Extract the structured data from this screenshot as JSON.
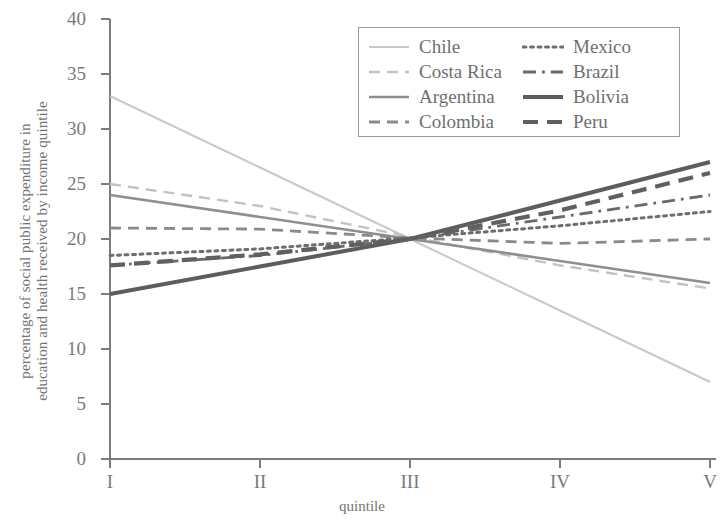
{
  "chart_data": {
    "type": "line",
    "title": "",
    "xlabel": "quintile",
    "ylabel": "percentage of social public expenditure in education and health received by income quintile",
    "ylabel_lines": [
      "percentage of social public expenditure in",
      "education and health received by income quintile"
    ],
    "categories": [
      "I",
      "II",
      "III",
      "IV",
      "V"
    ],
    "x_ticklabels": [
      "I",
      "II",
      "III",
      "IV",
      "V"
    ],
    "y_ticklabels": [
      "0",
      "5",
      "10",
      "15",
      "20",
      "25",
      "30",
      "35",
      "40"
    ],
    "yticks": [
      0,
      5,
      10,
      15,
      20,
      25,
      30,
      35,
      40
    ],
    "ylim": [
      0,
      40
    ],
    "xlim": [
      1,
      5
    ],
    "grid": false,
    "legend_position": "upper right",
    "series": [
      {
        "name": "Chile",
        "values": [
          33.0,
          26.5,
          20.0,
          13.5,
          7.0
        ],
        "style": "solid-thin",
        "color": "#c9c9c9",
        "width": 2.0
      },
      {
        "name": "Costa Rica",
        "values": [
          25.0,
          23.0,
          20.2,
          17.6,
          15.5
        ],
        "style": "dashed",
        "color": "#c2c2c2",
        "width": 2.4
      },
      {
        "name": "Argentina",
        "values": [
          24.0,
          22.0,
          20.0,
          18.0,
          16.0
        ],
        "style": "solid",
        "color": "#8f8f8f",
        "width": 2.6
      },
      {
        "name": "Colombia",
        "values": [
          21.0,
          20.9,
          20.1,
          19.6,
          20.0
        ],
        "style": "dashed",
        "color": "#8a8a8a",
        "width": 2.8
      },
      {
        "name": "Mexico",
        "values": [
          18.5,
          19.1,
          20.1,
          21.2,
          22.5
        ],
        "style": "dotted",
        "color": "#6e6e6e",
        "width": 3.0
      },
      {
        "name": "Brazil",
        "values": [
          17.6,
          18.5,
          20.0,
          22.0,
          24.0
        ],
        "style": "dash-dot",
        "color": "#6a6a6a",
        "width": 2.8
      },
      {
        "name": "Bolivia",
        "values": [
          15.0,
          17.5,
          20.0,
          23.5,
          27.0
        ],
        "style": "solid-thick",
        "color": "#5d5d5d",
        "width": 4.0
      },
      {
        "name": "Peru",
        "values": [
          17.6,
          18.6,
          20.0,
          22.6,
          26.0
        ],
        "style": "dashed-thick",
        "color": "#606060",
        "width": 4.2
      }
    ],
    "legend": {
      "left_column": [
        "Chile",
        "Costa Rica",
        "Argentina",
        "Colombia"
      ],
      "right_column": [
        "Mexico",
        "Brazil",
        "Bolivia",
        "Peru"
      ]
    }
  },
  "axes": {
    "y_title_line1": "percentage of social public expenditure in",
    "y_title_line2": "education and health received by income quintile",
    "x_title": "quintile"
  }
}
